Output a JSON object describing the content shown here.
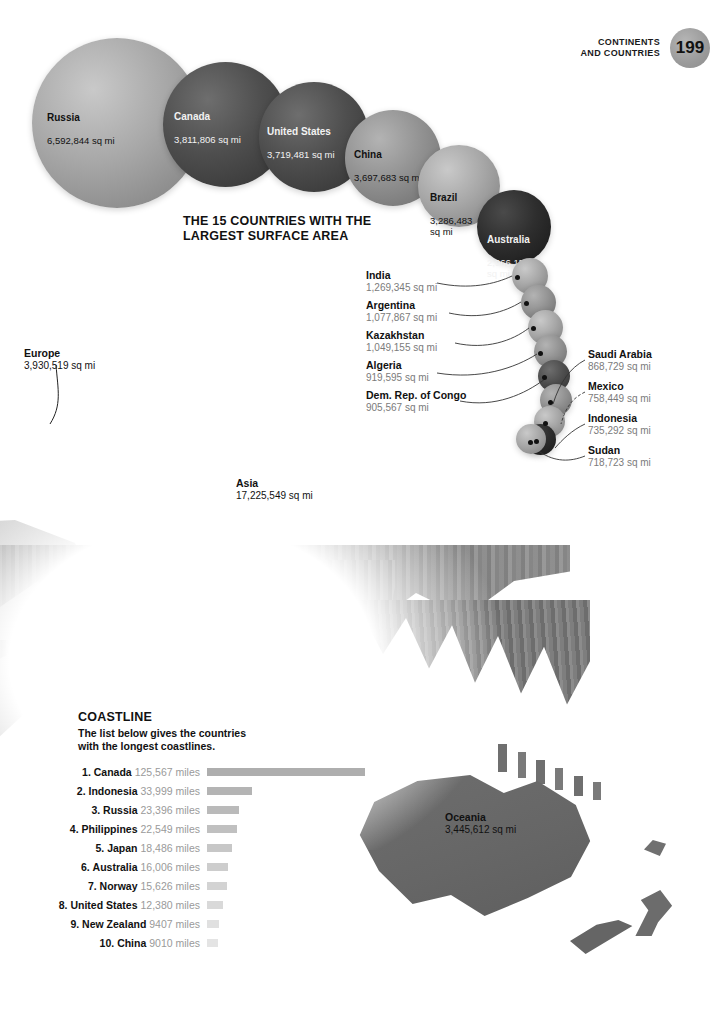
{
  "header": {
    "title": "CONTINENTS\nAND COUNTRIES",
    "page_number": "199",
    "page_circle_color": "#9b9b9b"
  },
  "chart_title": "THE 15 COUNTRIES WITH THE\nLARGEST SURFACE AREA",
  "chart_data": {
    "type": "bubble",
    "title": "THE 15 COUNTRIES WITH THE LARGEST SURFACE AREA",
    "unit": "sq mi",
    "xlabel": "",
    "ylabel": "Surface area",
    "categories": [
      "Russia",
      "Canada",
      "United States",
      "China",
      "Brazil",
      "Australia",
      "India",
      "Argentina",
      "Kazakhstan",
      "Algeria",
      "Dem. Rep. of Congo",
      "Saudi Arabia",
      "Mexico",
      "Indonesia",
      "Sudan"
    ],
    "values": [
      6592844,
      3811806,
      3719481,
      3697683,
      3286483,
      2966150,
      1269345,
      1077867,
      1049155,
      919595,
      905567,
      868729,
      758449,
      735292,
      718723
    ],
    "value_labels": [
      "6,592,844 sq mi",
      "3,811,806 sq mi",
      "3,719,481 sq mi",
      "3,697,683 sq mi",
      "3,286,483 sq mi",
      "2,966,150 sq mi",
      "1,269,345 sq mi",
      "1,077,867 sq mi",
      "1,049,155 sq mi",
      "919,595 sq mi",
      "905,567 sq mi",
      "868,729 sq mi",
      "758,449 sq mi",
      "735,292 sq mi",
      "718,723 sq mi"
    ],
    "bubbles": [
      {
        "name": "Russia",
        "value_label": "6,592,844 sq mi",
        "shade": "light"
      },
      {
        "name": "Canada",
        "value_label": "3,811,806 sq mi",
        "shade": "dark"
      },
      {
        "name": "United States",
        "value_label": "3,719,481 sq mi",
        "shade": "dark"
      },
      {
        "name": "China",
        "value_label": "3,697,683 sq mi",
        "shade": "mid"
      },
      {
        "name": "Brazil",
        "value_label": "3,286,483\nsq mi",
        "shade": "light"
      },
      {
        "name": "Australia",
        "value_label": "2,966,150\nsq mi",
        "shade": "xdark"
      },
      {
        "name": "India",
        "value_label": "1,269,345 sq mi",
        "shade": "light"
      },
      {
        "name": "Argentina",
        "value_label": "1,077,867 sq mi",
        "shade": "mid"
      },
      {
        "name": "Kazakhstan",
        "value_label": "1,049,155 sq mi",
        "shade": "light"
      },
      {
        "name": "Algeria",
        "value_label": "919,595 sq mi",
        "shade": "mid"
      },
      {
        "name": "Dem. Rep. of Congo",
        "value_label": "905,567 sq mi",
        "shade": "dark"
      },
      {
        "name": "Saudi Arabia",
        "value_label": "868,729 sq mi",
        "shade": "mid"
      },
      {
        "name": "Mexico",
        "value_label": "758,449 sq mi",
        "shade": "light"
      },
      {
        "name": "Indonesia",
        "value_label": "735,292 sq mi",
        "shade": "xdark"
      },
      {
        "name": "Sudan",
        "value_label": "718,723 sq mi",
        "shade": "light"
      }
    ]
  },
  "continent_labels": [
    {
      "name": "Europe",
      "value_label": "3,930,519 sq mi"
    },
    {
      "name": "Asia",
      "value_label": "17,225,549 sq mi"
    },
    {
      "name": "Oceania",
      "value_label": "3,445,612 sq mi"
    }
  ],
  "coastline": {
    "heading": "COASTLINE",
    "intro": "The list below gives the countries\nwith the longest coastlines.",
    "unit": "miles",
    "rows": [
      {
        "rank": "1.",
        "country": "Canada",
        "value": "125,567",
        "unit": "miles",
        "bar_width": 158,
        "bar_color": "#aeaeae"
      },
      {
        "rank": "2.",
        "country": "Indonesia",
        "value": "33,999",
        "unit": "miles",
        "bar_width": 45,
        "bar_color": "#b4b4b4"
      },
      {
        "rank": "3.",
        "country": "Russia",
        "value": "23,396",
        "unit": "miles",
        "bar_width": 32,
        "bar_color": "#bababa"
      },
      {
        "rank": "4.",
        "country": "Philippines",
        "value": "22,549",
        "unit": "miles",
        "bar_width": 30,
        "bar_color": "#c0c0c0"
      },
      {
        "rank": "5.",
        "country": "Japan",
        "value": "18,486",
        "unit": "miles",
        "bar_width": 25,
        "bar_color": "#c7c7c7"
      },
      {
        "rank": "6.",
        "country": "Australia",
        "value": "16,006",
        "unit": "miles",
        "bar_width": 21,
        "bar_color": "#cdcdcd"
      },
      {
        "rank": "7.",
        "country": "Norway",
        "value": "15,626",
        "unit": "miles",
        "bar_width": 20,
        "bar_color": "#d3d3d3"
      },
      {
        "rank": "8.",
        "country": "United States",
        "value": "12,380",
        "unit": "miles",
        "bar_width": 16,
        "bar_color": "#d9d9d9"
      },
      {
        "rank": "9.",
        "country": "New Zealand",
        "value": "9407",
        "unit": "miles",
        "bar_width": 12,
        "bar_color": "#e0e0e0"
      },
      {
        "rank": "10.",
        "country": "China",
        "value": "9010",
        "unit": "miles",
        "bar_width": 11,
        "bar_color": "#e4e4e4"
      }
    ]
  }
}
